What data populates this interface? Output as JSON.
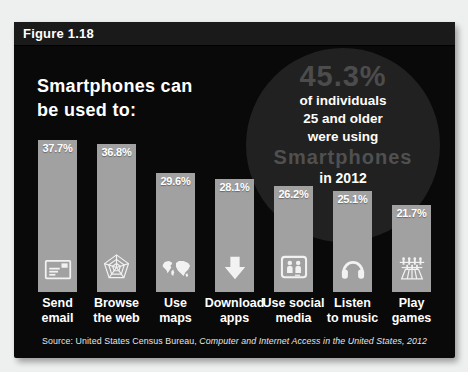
{
  "figure": {
    "label": "Figure 1.18",
    "title": {
      "line1": "Smartphones can",
      "line2": "be used to:"
    }
  },
  "callout": {
    "pct": "45.3%",
    "line1": "of individuals",
    "line2": "25 and older",
    "line3": "were using",
    "highlight": "Smartphones",
    "line4": "in 2012"
  },
  "source": {
    "prefix": "Source: United States Census Bureau, ",
    "citation": "Computer and Internet Access in the United States, 2012"
  },
  "chart_data": {
    "type": "bar",
    "title": "Smartphones can be used to:",
    "categories": [
      "Send\nemail",
      "Browse\nthe web",
      "Use\nmaps",
      "Download\napps",
      "Use social\nmedia",
      "Listen\nto music",
      "Play\ngames"
    ],
    "values": [
      37.7,
      36.8,
      29.6,
      28.1,
      26.2,
      25.1,
      21.7
    ],
    "value_labels": [
      "37.7%",
      "36.8%",
      "29.6%",
      "28.1%",
      "26.2%",
      "25.1%",
      "21.7%"
    ],
    "icons": [
      "email-icon",
      "web-icon",
      "maps-icon",
      "download-icon",
      "social-media-icon",
      "music-icon",
      "games-icon"
    ],
    "annotation": "45.3% of individuals 25 and older were using Smartphones in 2012",
    "xlabel": "",
    "ylabel": "",
    "ylim": [
      0,
      40
    ],
    "grid": false,
    "legend": "none",
    "colors": {
      "bar": "#a1a1a1",
      "background": "#090909",
      "value_label": "#ffffff",
      "callout_circle": "#212121",
      "callout_gray_text": "#4c4c4c",
      "page_background": "#eef0ef"
    }
  }
}
